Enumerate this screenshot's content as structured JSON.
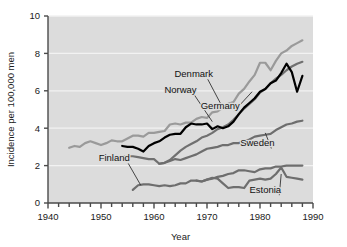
{
  "chart_data": {
    "type": "line",
    "title": "",
    "xlabel": "Year",
    "ylabel": "Incidence per 100,000 men",
    "xlim": [
      1940,
      1990
    ],
    "ylim": [
      0,
      10
    ],
    "xticks": [
      1940,
      1950,
      1960,
      1970,
      1980,
      1990
    ],
    "yticks": [
      0,
      2,
      4,
      6,
      8,
      10
    ],
    "xtick_labels": [
      "1940",
      "1950",
      "1960",
      "1970",
      "1980",
      "1990"
    ],
    "ytick_labels": [
      "0",
      "2",
      "4",
      "6",
      "8",
      "10"
    ],
    "xminor_step": 2,
    "grid": "horizontal-white",
    "legend": "inline-annotations",
    "plot_background": "#dcdcdc",
    "series": [
      {
        "name": "Denmark",
        "color": "#9a9a9a",
        "width": 2.2,
        "label_x": 1967.5,
        "label_y": 6.75,
        "leader_to_x": 1972.5,
        "leader_to_y": 5.35,
        "x": [
          1944,
          1945,
          1946,
          1947,
          1948,
          1949,
          1950,
          1951,
          1952,
          1953,
          1954,
          1955,
          1956,
          1957,
          1958,
          1959,
          1960,
          1961,
          1962,
          1963,
          1964,
          1965,
          1966,
          1967,
          1968,
          1969,
          1970,
          1971,
          1972,
          1973,
          1974,
          1975,
          1976,
          1977,
          1978,
          1979,
          1980,
          1981,
          1982,
          1983,
          1984,
          1985,
          1986,
          1987,
          1988
        ],
        "y": [
          2.95,
          3.05,
          3.0,
          3.2,
          3.3,
          3.2,
          3.1,
          3.2,
          3.35,
          3.3,
          3.3,
          3.45,
          3.6,
          3.6,
          3.55,
          3.75,
          3.75,
          3.8,
          3.85,
          4.2,
          4.25,
          4.2,
          4.3,
          4.3,
          4.5,
          4.6,
          4.55,
          4.85,
          4.9,
          5.1,
          5.3,
          5.4,
          5.85,
          6.1,
          6.5,
          6.85,
          7.5,
          7.5,
          7.1,
          7.6,
          8.0,
          8.15,
          8.4,
          8.55,
          8.7
        ]
      },
      {
        "name": "Norway",
        "color": "#707070",
        "width": 2.2,
        "label_x": 1965.0,
        "label_y": 5.9,
        "leader_to_x": 1971.0,
        "leader_to_y": 4.35,
        "x": [
          1954,
          1955,
          1956,
          1957,
          1958,
          1959,
          1960,
          1961,
          1962,
          1963,
          1964,
          1965,
          1966,
          1967,
          1968,
          1969,
          1970,
          1971,
          1972,
          1973,
          1974,
          1975,
          1976,
          1977,
          1978,
          1979,
          1980,
          1981,
          1982,
          1983,
          1984,
          1985,
          1986,
          1987,
          1988
        ],
        "y": [
          2.5,
          2.5,
          2.5,
          2.45,
          2.4,
          2.35,
          2.35,
          2.1,
          2.15,
          2.3,
          2.55,
          2.8,
          3.0,
          3.15,
          3.3,
          3.5,
          3.6,
          3.75,
          3.95,
          4.05,
          4.2,
          4.45,
          4.75,
          5.05,
          5.3,
          5.55,
          5.9,
          6.1,
          6.4,
          6.65,
          6.85,
          7.1,
          7.3,
          7.45,
          7.55
        ]
      },
      {
        "name": "Germany",
        "color": "#000000",
        "width": 2.2,
        "label_x": 1972.5,
        "label_y": 5.05,
        "leader_to_x": 1978.5,
        "leader_to_y": 5.95,
        "x": [
          1954,
          1955,
          1956,
          1957,
          1958,
          1959,
          1960,
          1961,
          1962,
          1963,
          1964,
          1965,
          1966,
          1967,
          1968,
          1969,
          1970,
          1971,
          1972,
          1973,
          1974,
          1975,
          1976,
          1977,
          1978,
          1979,
          1980,
          1981,
          1982,
          1983,
          1984,
          1985,
          1986,
          1987,
          1988
        ],
        "y": [
          3.05,
          3.0,
          3.0,
          2.9,
          2.75,
          3.05,
          3.2,
          3.3,
          3.5,
          3.65,
          3.7,
          3.7,
          4.05,
          4.25,
          4.2,
          4.2,
          4.25,
          3.95,
          4.1,
          4.0,
          4.1,
          4.35,
          4.75,
          5.1,
          5.35,
          5.6,
          5.95,
          6.1,
          6.4,
          6.55,
          6.95,
          7.45,
          7.0,
          5.95,
          6.8
        ]
      },
      {
        "name": "Sweden",
        "color": "#6e6e6e",
        "width": 2.2,
        "label_x": 1979.5,
        "label_y": 3.05,
        "leader_to_x": 1981.0,
        "leader_to_y": 3.75,
        "x": [
          1961,
          1962,
          1963,
          1964,
          1965,
          1966,
          1967,
          1968,
          1969,
          1970,
          1971,
          1972,
          1973,
          1974,
          1975,
          1976,
          1977,
          1978,
          1979,
          1980,
          1981,
          1982,
          1983,
          1984,
          1985,
          1986,
          1987,
          1988
        ],
        "y": [
          2.1,
          2.15,
          2.25,
          2.35,
          2.3,
          2.4,
          2.5,
          2.6,
          2.75,
          2.9,
          2.95,
          3.0,
          3.1,
          3.1,
          3.2,
          3.2,
          3.3,
          3.4,
          3.55,
          3.6,
          3.65,
          3.7,
          3.9,
          4.05,
          4.2,
          4.25,
          4.35,
          4.4
        ]
      },
      {
        "name": "Finland",
        "color": "#6e6e6e",
        "width": 2.2,
        "label_x": 1952.5,
        "label_y": 2.25,
        "leader_to_x": 1957.5,
        "leader_to_y": 0.95,
        "x": [
          1956,
          1957,
          1958,
          1959,
          1960,
          1961,
          1962,
          1963,
          1964,
          1965,
          1966,
          1967,
          1968,
          1969,
          1970,
          1971,
          1972,
          1973,
          1974,
          1975,
          1976,
          1977,
          1978,
          1979,
          1980,
          1981,
          1982,
          1983,
          1984,
          1985,
          1986,
          1987,
          1988
        ],
        "y": [
          0.7,
          0.95,
          1.0,
          1.0,
          0.95,
          0.9,
          0.95,
          0.9,
          0.95,
          1.05,
          1.05,
          1.2,
          1.2,
          1.15,
          1.25,
          1.3,
          1.4,
          1.45,
          1.55,
          1.6,
          1.75,
          1.75,
          1.7,
          1.65,
          1.8,
          1.85,
          1.85,
          1.95,
          1.95,
          2.0,
          2.0,
          2.0,
          2.0
        ]
      },
      {
        "name": "Estonia",
        "color": "#6e6e6e",
        "width": 2.2,
        "label_x": 1981.0,
        "label_y": 0.55,
        "leader_to_x": 1984.0,
        "leader_to_y": 1.55,
        "x": [
          1968,
          1969,
          1970,
          1971,
          1972,
          1973,
          1974,
          1975,
          1976,
          1977,
          1978,
          1979,
          1980,
          1981,
          1982,
          1983,
          1984,
          1985,
          1986,
          1987,
          1988
        ],
        "y": [
          1.2,
          1.15,
          1.25,
          1.35,
          1.3,
          1.05,
          0.8,
          0.85,
          0.85,
          0.8,
          1.2,
          1.25,
          1.3,
          1.25,
          1.3,
          1.55,
          1.9,
          1.4,
          1.35,
          1.3,
          1.25
        ]
      }
    ]
  }
}
